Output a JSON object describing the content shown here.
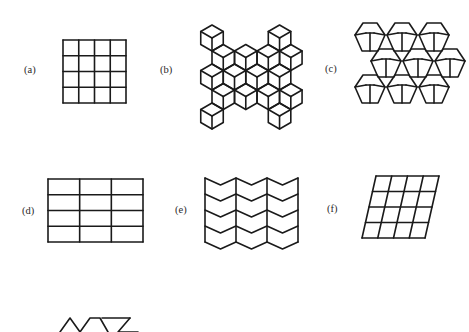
{
  "figure": {
    "panels": [
      {
        "id": "a",
        "label": "(a)",
        "description": "square grid tiling",
        "cols": 4,
        "rows": 4
      },
      {
        "id": "b",
        "label": "(b)",
        "description": "rhombus (3D cube) tiling"
      },
      {
        "id": "c",
        "label": "(c)",
        "description": "Cairo pentagonal tiling"
      },
      {
        "id": "d",
        "label": "(d)",
        "description": "rectangular grid tiling",
        "cols": 3,
        "rows": 4
      },
      {
        "id": "e",
        "label": "(e)",
        "description": "chevron / herringbone tiling",
        "cols": 3,
        "rows": 4
      },
      {
        "id": "f",
        "label": "(f)",
        "description": "parallelogram grid tiling",
        "cols": 4,
        "rows": 4
      },
      {
        "id": "g",
        "label": "",
        "description": "partially visible triangle tiling (cropped)"
      }
    ],
    "colors": {
      "background": "#ffffff",
      "stroke": "#1a1a1a",
      "text": "#2a2a2a"
    }
  }
}
